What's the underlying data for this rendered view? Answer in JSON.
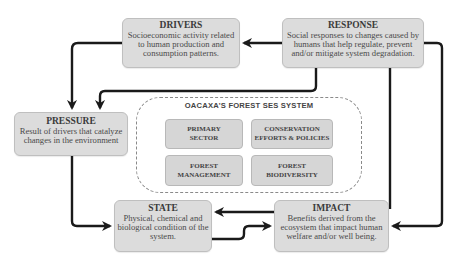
{
  "diagram": {
    "nodes": {
      "drivers": {
        "title": "DRIVERS",
        "description": "Socioeconomic activity related to human production and consumption patterns."
      },
      "response": {
        "title": "RESPONSE",
        "description": "Social responses to changes caused by humans that help regulate, prevent and/or mitigate system degradation."
      },
      "pressure": {
        "title": "PRESSURE",
        "description": "Result of drivers that catalyze changes in the environment"
      },
      "state": {
        "title": "STATE",
        "description": "Physical, chemical and biological condition of the system."
      },
      "impact": {
        "title": "IMPACT",
        "description": "Benefits derived from the ecosystem that impact human welfare and/or well being."
      }
    },
    "system": {
      "title": "OACAXA'S FOREST SES SYSTEM",
      "components": [
        {
          "label": "PRIMARY SECTOR"
        },
        {
          "label": "CONSERVATION EFFORTS & POLICIES"
        },
        {
          "label": "FOREST MANAGEMENT"
        },
        {
          "label": "FOREST BIODIVERSITY"
        }
      ]
    },
    "edges": [
      {
        "from": "drivers",
        "to": "pressure"
      },
      {
        "from": "response",
        "to": "drivers"
      },
      {
        "from": "response",
        "to": "pressure"
      },
      {
        "from": "response",
        "to": "impact"
      },
      {
        "from": "response",
        "to": "impact",
        "route": "outer-right"
      },
      {
        "from": "pressure",
        "to": "state"
      },
      {
        "from": "impact",
        "to": "state"
      },
      {
        "from": "state",
        "to": "impact"
      }
    ],
    "colors": {
      "box_fill": "#dcdcdc",
      "arrow": "#1a1a1a",
      "dashed_border": "#8a8a8a"
    }
  }
}
